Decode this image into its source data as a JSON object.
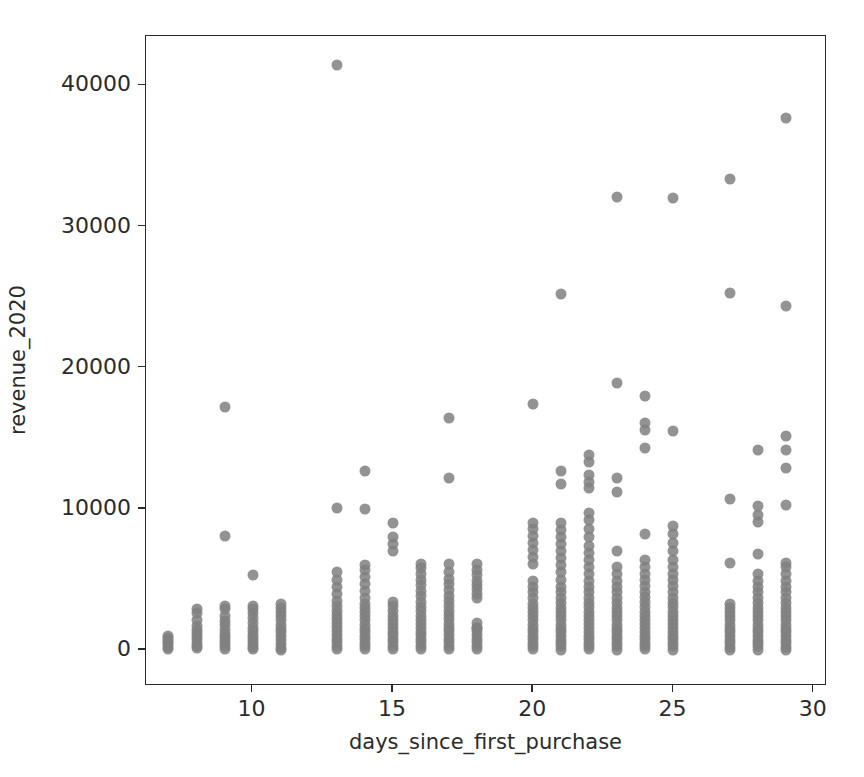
{
  "chart_data": {
    "type": "scatter",
    "title": "",
    "xlabel": "days_since_first_purchase",
    "ylabel": "revenue_2020",
    "xlim": [
      6.2,
      30.4
    ],
    "ylim": [
      -2400,
      43500
    ],
    "xticks": [
      10,
      15,
      20,
      25,
      30
    ],
    "xtick_labels": [
      "10",
      "15",
      "20",
      "25",
      "30"
    ],
    "yticks": [
      0,
      10000,
      20000,
      30000,
      40000
    ],
    "ytick_labels": [
      "0",
      "10000",
      "20000",
      "30000",
      "40000"
    ],
    "grid": false,
    "legend": false,
    "marker_color": "#808080",
    "marker_size": 11,
    "marker_opacity": 0.85,
    "axes_color": "#2b2b2b",
    "background_color": "#ffffff",
    "note": "Revenue values clustered in vertical stripes at integer day values; gaps at days 12, 19 and 26.",
    "series": [
      {
        "name": "customers",
        "columns": [
          {
            "x": 7,
            "values": [
              100,
              250,
              400,
              560,
              700,
              860,
              1000
            ]
          },
          {
            "x": 8,
            "values": [
              120,
              300,
              520,
              760,
              980,
              1200,
              1450,
              1700,
              2100,
              2650,
              2900
            ]
          },
          {
            "x": 9,
            "values": [
              80,
              260,
              470,
              690,
              900,
              1150,
              1400,
              1750,
              2050,
              2400,
              2900,
              3150,
              8050,
              17250
            ]
          },
          {
            "x": 10,
            "values": [
              60,
              220,
              430,
              640,
              870,
              1100,
              1330,
              1600,
              1900,
              2250,
              2600,
              2900,
              3100,
              5300
            ]
          },
          {
            "x": 11,
            "values": [
              30,
              180,
              420,
              700,
              980,
              1250,
              1500,
              1800,
              2100,
              2400,
              2700,
              3000,
              3250
            ]
          },
          {
            "x": 13,
            "values": [
              80,
              300,
              560,
              820,
              1080,
              1350,
              1620,
              1900,
              2200,
              2500,
              2800,
              3100,
              3500,
              4000,
              4500,
              5000,
              5500,
              10050,
              41450
            ]
          },
          {
            "x": 14,
            "values": [
              60,
              280,
              520,
              760,
              1000,
              1260,
              1520,
              1800,
              2100,
              2400,
              2700,
              3000,
              3300,
              3700,
              4200,
              4700,
              5200,
              5700,
              6000,
              10000,
              12700
            ]
          },
          {
            "x": 15,
            "values": [
              70,
              300,
              550,
              800,
              1050,
              1300,
              1560,
              1850,
              2150,
              2450,
              2800,
              3100,
              3400,
              7000,
              7500,
              8000,
              9000
            ]
          },
          {
            "x": 16,
            "values": [
              60,
              290,
              540,
              790,
              1040,
              1300,
              1560,
              1850,
              2150,
              2450,
              2750,
              3050,
              3400,
              3800,
              4200,
              4600,
              5000,
              5400,
              5800,
              6100
            ]
          },
          {
            "x": 17,
            "values": [
              70,
              310,
              560,
              810,
              1060,
              1320,
              1580,
              1870,
              2180,
              2480,
              2780,
              3100,
              3450,
              3850,
              4250,
              4650,
              5050,
              5500,
              6100,
              12200,
              16450
            ]
          },
          {
            "x": 18,
            "values": [
              60,
              290,
              540,
              800,
              1060,
              1330,
              1600,
              1900,
              1550,
              3700,
              4000,
              4300,
              4600,
              4900,
              5300,
              5700,
              6100
            ]
          },
          {
            "x": 20,
            "values": [
              50,
              270,
              510,
              760,
              1010,
              1270,
              1530,
              1800,
              2100,
              2400,
              2700,
              3000,
              3300,
              3700,
              4100,
              4500,
              4900,
              6100,
              6600,
              7100,
              7600,
              8100,
              8600,
              9000,
              17400
            ]
          },
          {
            "x": 21,
            "values": [
              40,
              260,
              500,
              750,
              1000,
              1260,
              1520,
              1800,
              2100,
              2400,
              2700,
              3000,
              3350,
              3700,
              4100,
              4500,
              5000,
              5500,
              6000,
              6500,
              7000,
              7500,
              8000,
              8500,
              9000,
              11800,
              12700,
              25200
            ]
          },
          {
            "x": 22,
            "values": [
              50,
              280,
              520,
              770,
              1020,
              1280,
              1540,
              1820,
              2120,
              2420,
              2720,
              3020,
              3350,
              3700,
              4100,
              4500,
              4900,
              5400,
              5900,
              6400,
              6900,
              7400,
              8000,
              8600,
              9200,
              9700,
              11500,
              11900,
              12400,
              13300,
              13800
            ]
          },
          {
            "x": 23,
            "values": [
              40,
              270,
              510,
              760,
              1010,
              1270,
              1530,
              1810,
              2110,
              2410,
              2710,
              3010,
              3350,
              3700,
              4100,
              4500,
              4900,
              5400,
              5900,
              7000,
              11200,
              12200,
              18900,
              32100
            ]
          },
          {
            "x": 24,
            "values": [
              50,
              280,
              520,
              770,
              1020,
              1280,
              1550,
              1830,
              2130,
              2430,
              2730,
              3030,
              3380,
              3730,
              4130,
              4530,
              4950,
              5400,
              5900,
              6400,
              8200,
              14300,
              15600,
              16100,
              18000
            ]
          },
          {
            "x": 25,
            "values": [
              40,
              270,
              510,
              760,
              1010,
              1270,
              1540,
              1820,
              2120,
              2420,
              2720,
              3020,
              3370,
              3720,
              4120,
              4520,
              4950,
              5400,
              5900,
              6400,
              7000,
              7600,
              8200,
              8800,
              15500,
              32000
            ]
          },
          {
            "x": 27,
            "values": [
              30,
              250,
              490,
              740,
              990,
              1250,
              1520,
              1800,
              2100,
              2400,
              2700,
              3000,
              3300,
              6200,
              10700,
              25300,
              33400
            ]
          },
          {
            "x": 28,
            "values": [
              40,
              260,
              500,
              750,
              1000,
              1260,
              1530,
              1810,
              2110,
              2410,
              2710,
              3010,
              3350,
              3700,
              4100,
              4500,
              4900,
              5400,
              6800,
              9100,
              9600,
              10200,
              14200
            ]
          },
          {
            "x": 29,
            "values": [
              30,
              250,
              490,
              740,
              990,
              1250,
              1520,
              1800,
              2100,
              2400,
              2700,
              3000,
              3350,
              3700,
              4100,
              4500,
              4900,
              5400,
              5900,
              6200,
              10300,
              12900,
              14200,
              15200,
              24400,
              37700
            ]
          }
        ]
      }
    ]
  }
}
